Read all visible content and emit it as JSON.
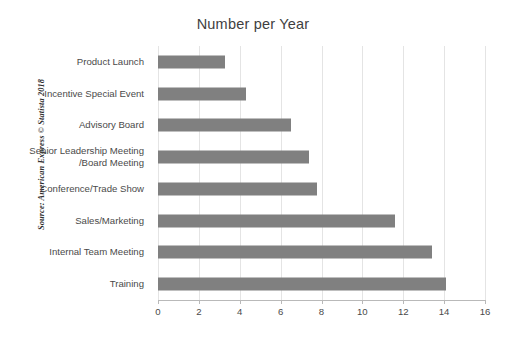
{
  "chart_data": {
    "type": "bar",
    "orientation": "horizontal",
    "title": "Number per Year",
    "xlabel": "",
    "ylabel": "",
    "xlim": [
      0,
      16
    ],
    "xticks": [
      0,
      2,
      4,
      6,
      8,
      10,
      12,
      14,
      16
    ],
    "xtick_labels": [
      "0",
      "2",
      "4",
      "6",
      "8",
      "10",
      "12",
      "14",
      "16"
    ],
    "grid": "vertical",
    "legend": "none",
    "bar_color": "#808080",
    "gridline_color": "#e4e4e4",
    "axis_color": "#b9b9b9",
    "background_color": "#ffffff",
    "categories": [
      "Product Launch",
      "Incentive Special Event",
      "Advisory Board",
      "Senior Leadership Meeting\n/Board Meeting",
      "Conference/Trade Show",
      "Sales/Marketing",
      "Internal Team Meeting",
      "Training"
    ],
    "values": [
      3.3,
      4.3,
      6.5,
      7.4,
      7.8,
      11.6,
      13.4,
      14.1
    ]
  },
  "source": {
    "note": "Source: American Express © Statista 2018"
  }
}
